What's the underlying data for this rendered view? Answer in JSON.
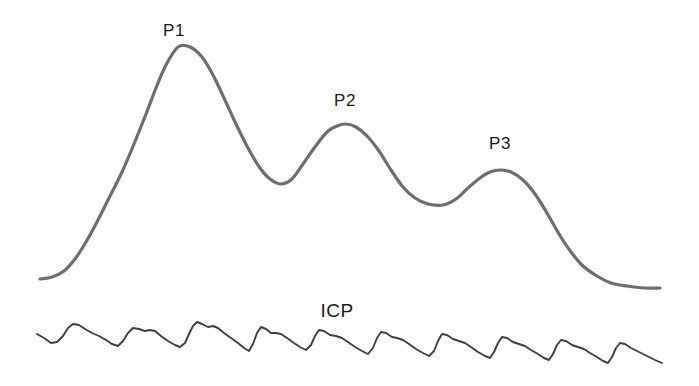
{
  "figure": {
    "background_color": "#ffffff",
    "width": 699,
    "height": 386
  },
  "labels": {
    "p1": "P1",
    "p2": "P2",
    "p3": "P3",
    "icp": "ICP"
  },
  "colors": {
    "idealized_wave": "#6e6e6e",
    "icp_trace": "#3f3f3f",
    "label_text": "#1a1a1a",
    "background": "#ffffff"
  },
  "chart_data": {
    "type": "line",
    "subtitle": "",
    "xlabel": "",
    "ylabel": "",
    "grid": false,
    "legend": null,
    "xlim": [
      0,
      699
    ],
    "ylim": [
      386,
      0
    ],
    "annotations": [
      {
        "text": "P1",
        "x": 174,
        "y": 36,
        "describes": "percussion wave peak of idealized ICP waveform"
      },
      {
        "text": "P2",
        "x": 345,
        "y": 106,
        "describes": "tidal wave peak of idealized ICP waveform"
      },
      {
        "text": "P3",
        "x": 500,
        "y": 149,
        "describes": "dicrotic wave peak of idealized ICP waveform"
      },
      {
        "text": "ICP",
        "x": 337,
        "y": 317,
        "describes": "label for raw intracranial pressure recording trace"
      }
    ],
    "series": [
      {
        "name": "Idealized ICP pulse waveform",
        "color": "#6e6e6e",
        "stroke_width": 3.2,
        "smooth": true,
        "peaks": [
          {
            "label": "P1",
            "x": 178,
            "y": 47
          },
          {
            "label": "P2",
            "x": 346,
            "y": 124
          },
          {
            "label": "P3",
            "x": 500,
            "y": 170
          }
        ],
        "troughs": [
          {
            "x": 281,
            "y": 184
          },
          {
            "x": 443,
            "y": 205
          }
        ],
        "points": [
          [
            40,
            279
          ],
          [
            52,
            277
          ],
          [
            64,
            271
          ],
          [
            75,
            259
          ],
          [
            86,
            242
          ],
          [
            98,
            220
          ],
          [
            110,
            196
          ],
          [
            122,
            172
          ],
          [
            134,
            144
          ],
          [
            146,
            114
          ],
          [
            156,
            88
          ],
          [
            166,
            65
          ],
          [
            178,
            47
          ],
          [
            190,
            47
          ],
          [
            202,
            57
          ],
          [
            213,
            75
          ],
          [
            224,
            98
          ],
          [
            236,
            124
          ],
          [
            248,
            148
          ],
          [
            260,
            168
          ],
          [
            270,
            179
          ],
          [
            281,
            184
          ],
          [
            292,
            179
          ],
          [
            303,
            164
          ],
          [
            315,
            147
          ],
          [
            327,
            132
          ],
          [
            337,
            126
          ],
          [
            346,
            124
          ],
          [
            356,
            127
          ],
          [
            367,
            136
          ],
          [
            379,
            151
          ],
          [
            391,
            170
          ],
          [
            403,
            187
          ],
          [
            415,
            198
          ],
          [
            428,
            204
          ],
          [
            443,
            205
          ],
          [
            456,
            199
          ],
          [
            468,
            188
          ],
          [
            480,
            178
          ],
          [
            490,
            172
          ],
          [
            500,
            170
          ],
          [
            511,
            172
          ],
          [
            523,
            180
          ],
          [
            535,
            194
          ],
          [
            547,
            213
          ],
          [
            559,
            234
          ],
          [
            571,
            252
          ],
          [
            583,
            266
          ],
          [
            597,
            276
          ],
          [
            611,
            283
          ],
          [
            627,
            286
          ],
          [
            645,
            288
          ],
          [
            660,
            288
          ]
        ]
      },
      {
        "name": "Raw ICP recording trace",
        "color": "#3f3f3f",
        "stroke_width": 1.9,
        "smooth": false,
        "pulse_count": 18,
        "baseline_start_y": 335,
        "baseline_end_y": 352,
        "points": [
          [
            37,
            334
          ],
          [
            44,
            338
          ],
          [
            51,
            343
          ],
          [
            57,
            342
          ],
          [
            63,
            336
          ],
          [
            68,
            328
          ],
          [
            73,
            324
          ],
          [
            79,
            325
          ],
          [
            85,
            329
          ],
          [
            92,
            333
          ],
          [
            99,
            336
          ],
          [
            106,
            340
          ],
          [
            112,
            344
          ],
          [
            118,
            346
          ],
          [
            123,
            341
          ],
          [
            128,
            333
          ],
          [
            133,
            328
          ],
          [
            139,
            329
          ],
          [
            145,
            331
          ],
          [
            150,
            330
          ],
          [
            155,
            331
          ],
          [
            161,
            336
          ],
          [
            168,
            341
          ],
          [
            175,
            345
          ],
          [
            180,
            347
          ],
          [
            185,
            343
          ],
          [
            189,
            334
          ],
          [
            193,
            326
          ],
          [
            197,
            322
          ],
          [
            202,
            324
          ],
          [
            208,
            327
          ],
          [
            213,
            326
          ],
          [
            218,
            328
          ],
          [
            224,
            333
          ],
          [
            231,
            338
          ],
          [
            238,
            343
          ],
          [
            244,
            348
          ],
          [
            249,
            351
          ],
          [
            253,
            344
          ],
          [
            257,
            333
          ],
          [
            261,
            327
          ],
          [
            266,
            329
          ],
          [
            271,
            333
          ],
          [
            276,
            333
          ],
          [
            281,
            334
          ],
          [
            287,
            338
          ],
          [
            294,
            343
          ],
          [
            300,
            347
          ],
          [
            306,
            350
          ],
          [
            311,
            345
          ],
          [
            315,
            336
          ],
          [
            319,
            330
          ],
          [
            324,
            331
          ],
          [
            330,
            335
          ],
          [
            336,
            336
          ],
          [
            342,
            338
          ],
          [
            348,
            342
          ],
          [
            355,
            347
          ],
          [
            362,
            351
          ],
          [
            368,
            354
          ],
          [
            373,
            348
          ],
          [
            377,
            338
          ],
          [
            381,
            332
          ],
          [
            386,
            333
          ],
          [
            392,
            337
          ],
          [
            397,
            338
          ],
          [
            403,
            340
          ],
          [
            409,
            344
          ],
          [
            416,
            349
          ],
          [
            423,
            353
          ],
          [
            429,
            356
          ],
          [
            434,
            351
          ],
          [
            438,
            341
          ],
          [
            442,
            334
          ],
          [
            447,
            335
          ],
          [
            453,
            339
          ],
          [
            459,
            341
          ],
          [
            465,
            343
          ],
          [
            471,
            347
          ],
          [
            478,
            352
          ],
          [
            485,
            356
          ],
          [
            490,
            358
          ],
          [
            494,
            352
          ],
          [
            498,
            343
          ],
          [
            502,
            337
          ],
          [
            507,
            338
          ],
          [
            513,
            342
          ],
          [
            519,
            344
          ],
          [
            525,
            346
          ],
          [
            531,
            350
          ],
          [
            538,
            354
          ],
          [
            544,
            358
          ],
          [
            549,
            360
          ],
          [
            553,
            354
          ],
          [
            557,
            345
          ],
          [
            561,
            340
          ],
          [
            566,
            341
          ],
          [
            572,
            345
          ],
          [
            578,
            347
          ],
          [
            584,
            349
          ],
          [
            590,
            353
          ],
          [
            597,
            357
          ],
          [
            603,
            361
          ],
          [
            608,
            363
          ],
          [
            612,
            357
          ],
          [
            616,
            348
          ],
          [
            620,
            343
          ],
          [
            625,
            344
          ],
          [
            631,
            348
          ],
          [
            637,
            351
          ],
          [
            643,
            354
          ],
          [
            649,
            357
          ],
          [
            655,
            360
          ],
          [
            662,
            363
          ]
        ]
      }
    ]
  }
}
